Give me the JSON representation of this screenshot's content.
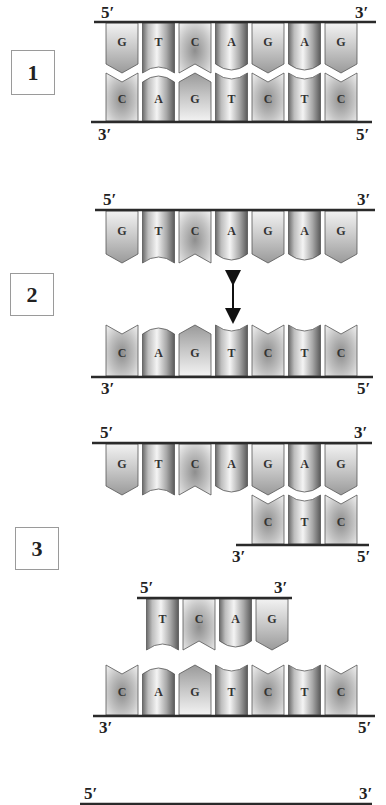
{
  "diagram": {
    "title": "",
    "colors": {
      "line": "#2a2a2a",
      "tile_stroke": "#555555",
      "text": "#222222"
    },
    "column_x": [
      106,
      142.5,
      179,
      215.5,
      252,
      288.5,
      325
    ],
    "tile_width": 32,
    "steps": [
      {
        "label": "1",
        "box": {
          "x": 11,
          "y": 50,
          "w": 44,
          "h": 45
        },
        "strands": [
          {
            "id": "s1-top",
            "orientation": "top",
            "line_y": 22,
            "line_x1": 94,
            "line_x2": 376,
            "tile_top": 23,
            "tile_bottom": 73,
            "start_col": 0,
            "bases": [
              "G",
              "T",
              "C",
              "A",
              "G",
              "A",
              "G"
            ],
            "end_labels": [
              {
                "text": "5′",
                "x": 101,
                "y": 4
              },
              {
                "text": "3′",
                "x": 355,
                "y": 4
              }
            ]
          },
          {
            "id": "s1-bottom",
            "orientation": "bottom",
            "line_y": 122,
            "line_x1": 91,
            "line_x2": 372,
            "tile_top": 73,
            "tile_bottom": 121,
            "start_col": 0,
            "bases": [
              "C",
              "A",
              "G",
              "T",
              "C",
              "T",
              "C"
            ],
            "end_labels": [
              {
                "text": "3′",
                "x": 98,
                "y": 126
              },
              {
                "text": "5′",
                "x": 356,
                "y": 126
              }
            ]
          }
        ]
      },
      {
        "label": "2",
        "box": {
          "x": 10,
          "y": 273,
          "w": 44,
          "h": 43
        },
        "arrow": {
          "x": 233,
          "y1": 274,
          "y2": 320,
          "name": "separation-double-arrow"
        },
        "strands": [
          {
            "id": "s2-top",
            "orientation": "top",
            "line_y": 210,
            "line_x1": 95,
            "line_x2": 375,
            "tile_top": 211,
            "tile_bottom": 263,
            "start_col": 0,
            "bases": [
              "G",
              "T",
              "C",
              "A",
              "G",
              "A",
              "G"
            ],
            "end_labels": [
              {
                "text": "5′",
                "x": 103,
                "y": 191
              },
              {
                "text": "3′",
                "x": 357,
                "y": 191
              }
            ]
          },
          {
            "id": "s2-bottom",
            "orientation": "bottom",
            "line_y": 377,
            "line_x1": 91,
            "line_x2": 373,
            "tile_top": 325,
            "tile_bottom": 376,
            "start_col": 0,
            "bases": [
              "C",
              "A",
              "G",
              "T",
              "C",
              "T",
              "C"
            ],
            "end_labels": [
              {
                "text": "3′",
                "x": 101,
                "y": 380
              },
              {
                "text": "5′",
                "x": 357,
                "y": 380
              }
            ]
          }
        ]
      },
      {
        "label": "3",
        "box": {
          "x": 15,
          "y": 527,
          "w": 44,
          "h": 43
        },
        "strands": [
          {
            "id": "s3-top",
            "orientation": "top",
            "line_y": 443,
            "line_x1": 92,
            "line_x2": 372,
            "tile_top": 444,
            "tile_bottom": 495,
            "start_col": 0,
            "bases": [
              "G",
              "T",
              "C",
              "A",
              "G",
              "A",
              "G"
            ],
            "end_labels": [
              {
                "text": "5′",
                "x": 100,
                "y": 424
              },
              {
                "text": "3′",
                "x": 354,
                "y": 424
              }
            ]
          },
          {
            "id": "s3-partial-bottom",
            "orientation": "bottom",
            "line_y": 545,
            "line_x1": 236,
            "line_x2": 369,
            "tile_top": 495,
            "tile_bottom": 544,
            "start_col": 4,
            "bases": [
              "C",
              "T",
              "C"
            ],
            "end_labels": [
              {
                "text": "3′",
                "x": 232,
                "y": 548
              },
              {
                "text": "5′",
                "x": 357,
                "y": 548
              }
            ]
          },
          {
            "id": "s3-fragment",
            "orientation": "top",
            "line_y": 598,
            "line_x1": 137,
            "line_x2": 292,
            "tile_top": 599,
            "tile_bottom": 650,
            "start_col": 1,
            "col_offset": 4,
            "bases": [
              "T",
              "C",
              "A",
              "G"
            ],
            "end_labels": [
              {
                "text": "5′",
                "x": 140,
                "y": 579
              },
              {
                "text": "3′",
                "x": 274,
                "y": 579
              }
            ]
          },
          {
            "id": "s3-bottom",
            "orientation": "bottom",
            "line_y": 716,
            "line_x1": 93,
            "line_x2": 375,
            "tile_top": 665,
            "tile_bottom": 715,
            "start_col": 0,
            "bases": [
              "C",
              "A",
              "G",
              "T",
              "C",
              "T",
              "C"
            ],
            "end_labels": [
              {
                "text": "3′",
                "x": 99,
                "y": 719
              },
              {
                "text": "5′",
                "x": 358,
                "y": 719
              }
            ]
          }
        ]
      },
      {
        "label": "",
        "strands": [
          {
            "id": "s4-top",
            "orientation": "top",
            "line_y": 804,
            "line_x1": 80,
            "line_x2": 372,
            "tile_top": 805,
            "tile_bottom": 805,
            "start_col": 0,
            "bases": [],
            "end_labels": [
              {
                "text": "5′",
                "x": 84,
                "y": 785
              },
              {
                "text": "3′",
                "x": 359,
                "y": 785
              }
            ]
          }
        ]
      }
    ]
  }
}
